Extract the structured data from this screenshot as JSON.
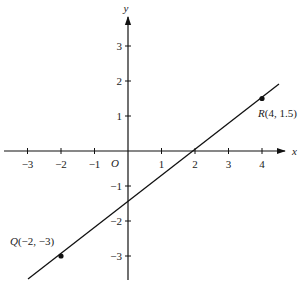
{
  "chart_data": {
    "type": "line",
    "title": "",
    "xlabel": "x",
    "ylabel": "y",
    "origin_label": "O",
    "xlim": [
      -3.6,
      4.7
    ],
    "ylim": [
      -3.7,
      3.9
    ],
    "grid": false,
    "x_ticks": [
      -3,
      -2,
      -1,
      1,
      2,
      3,
      4
    ],
    "x_tick_labels": [
      "−3",
      "−2",
      "−1",
      "1",
      "2",
      "3",
      "4"
    ],
    "y_ticks": [
      3,
      2,
      1,
      -1,
      -2,
      -3
    ],
    "y_tick_labels": [
      "3",
      "2",
      "1",
      "−1",
      "−2",
      "−3"
    ],
    "series": [
      {
        "name": "line QR",
        "slope": 0.75,
        "intercept": -1.5,
        "x": [
          -3.0,
          4.5
        ],
        "y": [
          -3.75,
          1.875
        ]
      }
    ],
    "points": [
      {
        "name": "Q",
        "x": -2,
        "y": -3,
        "label": "Q(−2, −3)"
      },
      {
        "name": "R",
        "x": 4,
        "y": 1.5,
        "label": "R(4, 1.5)"
      }
    ]
  },
  "labels": {
    "x_axis": "x",
    "y_axis": "y",
    "origin": "O",
    "point_q": "Q(−2, −3)",
    "point_r": "R(4, 1.5)",
    "xt": [
      "−3",
      "−2",
      "−1",
      "1",
      "2",
      "3",
      "4"
    ],
    "yt": [
      "3",
      "2",
      "1",
      "−1",
      "−2",
      "−3"
    ]
  }
}
